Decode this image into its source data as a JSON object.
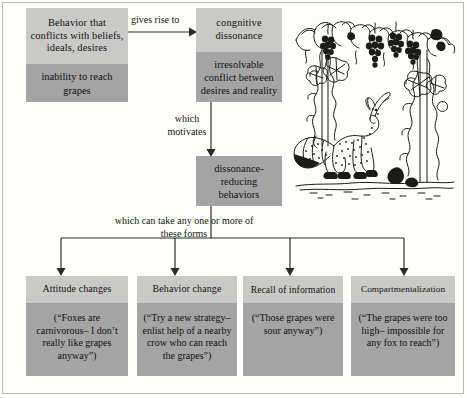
{
  "diagram": {
    "type": "flowchart",
    "colors": {
      "header_fill": "#c9c9c7",
      "body_fill": "#a4a4a4",
      "line": "#2b2b28",
      "page_background": "#fdfdfc"
    },
    "nodes": {
      "conflict": {
        "header": "Behavior that conflicts with beliefs, ideals, desires",
        "body": "inability to reach grapes"
      },
      "dissonance": {
        "header": "congnitive dissonance",
        "body": "irresolvable conflict between desires and reality"
      },
      "behaviors": {
        "body": "dissonance- reducing behaviors"
      }
    },
    "connectors": {
      "gives_rise_to": "gives rise to",
      "which_motivates": "which motivates",
      "which_can_take": "which can take any one or more of these forms"
    },
    "outcomes": [
      {
        "name": "attitude-changes",
        "header": "Attitude changes",
        "body": "(“Foxes are carnivorous– I don’t really like grapes anyway”)"
      },
      {
        "name": "behavior-change",
        "header": "Behavior change",
        "body": "(“Try a new strategy– enlist help of a nearby crow who can reach the grapes”)"
      },
      {
        "name": "recall-of-information",
        "header": "Recall of information",
        "body": "(“Those grapes were sour anyway”)"
      },
      {
        "name": "compartmentalization",
        "header": "Compartmentalization",
        "body": "(“The grapes were too high– impossible for any fox to reach”)"
      }
    ],
    "illustration": {
      "name": "fox-and-grapes-illustration",
      "description": "Line drawing of a fox looking up at bunches of grapes hanging from a grape arbor"
    }
  }
}
